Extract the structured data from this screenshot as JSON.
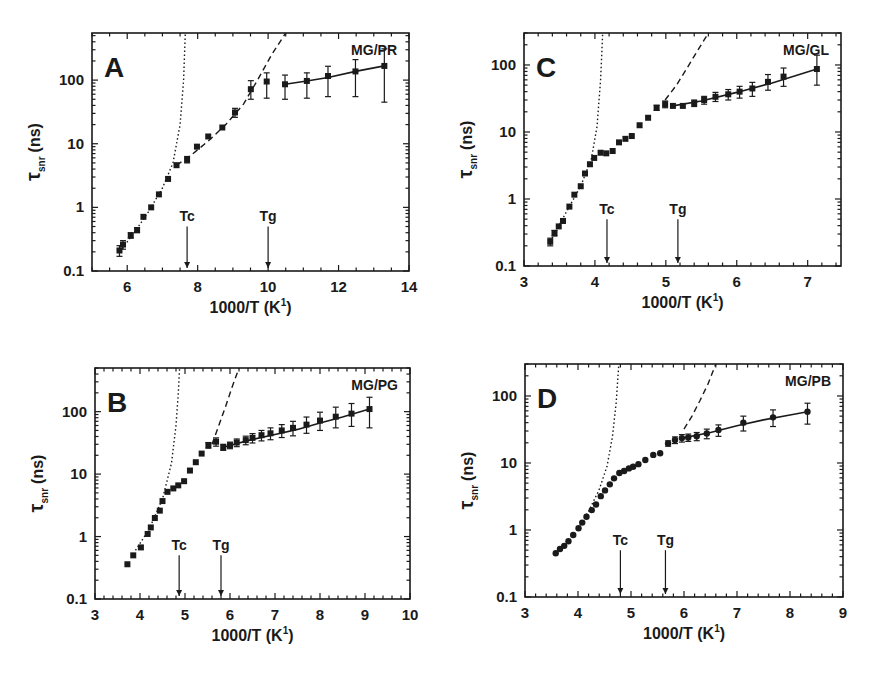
{
  "figure": {
    "panels_order": [
      "A",
      "C",
      "B",
      "D"
    ]
  },
  "chart_data": [
    {
      "id": "A",
      "type": "scatter",
      "panel_letter": "A",
      "system_label": "MG/PR",
      "title": "",
      "xlabel": "1000/T (K⁻¹)",
      "xlabel_main": "1000/T (K",
      "xlabel_sup": "1",
      "xlabel_end": ")",
      "ylabel": "τsnr (ns)",
      "ylabel_tau": "τ",
      "ylabel_sub": "snr",
      "ylabel_unit": "(ns)",
      "yscale": "log",
      "xlim": [
        5,
        14
      ],
      "ylim": [
        0.1,
        550
      ],
      "xticks": [
        6,
        8,
        10,
        12,
        14
      ],
      "xminor": 0.5,
      "yticks": [
        0.1,
        1,
        10,
        100
      ],
      "ytick_labels": [
        "0.1",
        "1",
        "10",
        "100"
      ],
      "grid": false,
      "markers": [
        {
          "label": "Tc",
          "x": 7.7
        },
        {
          "label": "Tg",
          "x": 10.0
        }
      ],
      "series": [
        {
          "name": "data",
          "marker": "square",
          "x": [
            5.78,
            5.88,
            6.1,
            6.28,
            6.46,
            6.68,
            6.9,
            7.16,
            7.4,
            7.7,
            7.98,
            8.3,
            8.7,
            9.06,
            9.51,
            9.96,
            10.48,
            11.1,
            11.7,
            12.48,
            13.3
          ],
          "y": [
            0.21,
            0.26,
            0.36,
            0.44,
            0.71,
            1.0,
            1.6,
            2.8,
            4.6,
            5.6,
            9,
            13,
            18,
            31,
            72,
            95,
            86,
            97,
            116,
            137,
            167
          ],
          "err_low": [
            0.17,
            0.22,
            0.33,
            0.4,
            0.66,
            0.94,
            1.5,
            2.6,
            4.3,
            5.0,
            8.3,
            12,
            17,
            26,
            50,
            52,
            50,
            52,
            55,
            55,
            45
          ],
          "err_high": [
            0.25,
            0.3,
            0.4,
            0.48,
            0.76,
            1.06,
            1.7,
            3.0,
            4.9,
            6.3,
            9.8,
            14,
            19,
            36,
            98,
            130,
            120,
            130,
            165,
            210,
            310
          ]
        },
        {
          "name": "solid fit (glass)",
          "style": "solid",
          "x": [
            10.48,
            11.1,
            11.7,
            12.48,
            13.3
          ],
          "y": [
            86,
            97,
            110,
            137,
            167
          ]
        },
        {
          "name": "dashed fit (supercooled)",
          "style": "dashed",
          "x": [
            7.4,
            7.8,
            8.3,
            8.8,
            9.3,
            9.7,
            10.1,
            10.5
          ],
          "y": [
            4.6,
            6.5,
            11,
            20,
            42,
            100,
            250,
            550
          ]
        },
        {
          "name": "dotted fit (liquid)",
          "style": "dotted",
          "x": [
            5.78,
            6.2,
            6.6,
            7.0,
            7.3,
            7.5,
            7.6,
            7.65
          ],
          "y": [
            0.2,
            0.4,
            0.85,
            2.0,
            5,
            20,
            100,
            550
          ]
        }
      ]
    },
    {
      "id": "C",
      "type": "scatter",
      "panel_letter": "C",
      "system_label": "MG/GL",
      "title": "",
      "xlabel": "1000/T (K⁻¹)",
      "xlabel_main": "1000/T (K",
      "xlabel_sup": "1",
      "xlabel_end": ")",
      "ylabel": "τsnr (ns)",
      "ylabel_tau": "τ",
      "ylabel_sub": "snr",
      "ylabel_unit": "(ns)",
      "yscale": "log",
      "xlim": [
        3,
        7.47
      ],
      "ylim": [
        0.1,
        300
      ],
      "xticks": [
        3,
        4,
        5,
        6,
        7
      ],
      "xminor": 0.2,
      "yticks": [
        0.1,
        1,
        10,
        100
      ],
      "ytick_labels": [
        "0.1",
        "1",
        "10",
        "100"
      ],
      "grid": false,
      "markers": [
        {
          "label": "Tc",
          "x": 4.17
        },
        {
          "label": "Tg",
          "x": 5.17
        }
      ],
      "series": [
        {
          "name": "data",
          "marker": "square",
          "x": [
            3.37,
            3.43,
            3.49,
            3.55,
            3.64,
            3.71,
            3.8,
            3.86,
            3.93,
            3.99,
            4.08,
            4.16,
            4.25,
            4.34,
            4.43,
            4.52,
            4.63,
            4.75,
            4.87,
            4.99,
            5.1,
            5.24,
            5.4,
            5.54,
            5.7,
            5.88,
            6.04,
            6.22,
            6.44,
            6.66,
            7.13
          ],
          "y": [
            0.23,
            0.31,
            0.39,
            0.47,
            0.77,
            1.16,
            1.55,
            2.4,
            3.3,
            4.1,
            4.9,
            4.8,
            5.2,
            7.0,
            7.9,
            8.7,
            12.6,
            16.3,
            23,
            26,
            24.5,
            24.5,
            27,
            30,
            33.5,
            36.5,
            40,
            44.6,
            56,
            67,
            87
          ],
          "err_low": [
            0.2,
            0.28,
            0.36,
            0.44,
            0.73,
            1.1,
            1.48,
            2.3,
            3.15,
            3.9,
            4.7,
            4.6,
            5.0,
            6.7,
            7.6,
            8.4,
            12,
            15.5,
            21,
            23,
            22.5,
            22.5,
            24,
            26,
            28.5,
            30,
            32,
            34,
            42,
            48,
            50
          ],
          "err_high": [
            0.26,
            0.34,
            0.42,
            0.5,
            0.81,
            1.22,
            1.62,
            2.5,
            3.45,
            4.3,
            5.1,
            5.0,
            5.4,
            7.3,
            8.2,
            9.0,
            13.2,
            17.1,
            25,
            29,
            26.5,
            26.5,
            30,
            34,
            39,
            43,
            48,
            55,
            72,
            90,
            140
          ]
        },
        {
          "name": "solid fit (glass)",
          "style": "solid",
          "x": [
            5.1,
            5.5,
            6.0,
            6.5,
            7.13
          ],
          "y": [
            24.5,
            29,
            39,
            54,
            87
          ]
        },
        {
          "name": "dashed fit (supercooled)",
          "style": "dashed",
          "x": [
            4.99,
            5.15,
            5.3,
            5.45,
            5.6
          ],
          "y": [
            30,
            50,
            90,
            165,
            300
          ]
        },
        {
          "name": "dotted fit (liquid)",
          "style": "dotted",
          "x": [
            3.37,
            3.6,
            3.8,
            3.95,
            4.03,
            4.08,
            4.11
          ],
          "y": [
            0.23,
            0.65,
            1.55,
            4.0,
            12,
            60,
            300
          ]
        }
      ]
    },
    {
      "id": "B",
      "type": "scatter",
      "panel_letter": "B",
      "system_label": "MG/PG",
      "title": "",
      "xlabel": "1000/T (K⁻¹)",
      "xlabel_main": "1000/T (K",
      "xlabel_sup": "1",
      "xlabel_end": ")",
      "ylabel": "τsnr (ns)",
      "ylabel_tau": "τ",
      "ylabel_sub": "snr",
      "ylabel_unit": "(ns)",
      "yscale": "log",
      "xlim": [
        3,
        10
      ],
      "ylim": [
        0.1,
        500
      ],
      "xticks": [
        3,
        4,
        5,
        6,
        7,
        8,
        9,
        10
      ],
      "xminor": 0.2,
      "yticks": [
        0.1,
        1,
        10,
        100
      ],
      "ytick_labels": [
        "0.1",
        "1",
        "10",
        "100"
      ],
      "grid": false,
      "markers": [
        {
          "label": "Tc",
          "x": 4.87
        },
        {
          "label": "Tg",
          "x": 5.8
        }
      ],
      "series": [
        {
          "name": "data",
          "marker": "square",
          "x": [
            3.72,
            3.85,
            4.02,
            4.17,
            4.24,
            4.33,
            4.44,
            4.5,
            4.61,
            4.74,
            4.85,
            4.98,
            5.11,
            5.24,
            5.37,
            5.52,
            5.69,
            5.85,
            6.0,
            6.15,
            6.35,
            6.5,
            6.7,
            6.9,
            7.15,
            7.4,
            7.7,
            8.0,
            8.35,
            8.7,
            9.1
          ],
          "y": [
            0.36,
            0.5,
            0.67,
            1.1,
            1.4,
            1.98,
            2.6,
            3.7,
            5.2,
            5.9,
            6.6,
            7.7,
            11.4,
            15.5,
            21.3,
            29,
            33,
            27,
            29,
            32,
            35,
            38,
            42,
            45,
            50,
            55,
            62,
            72,
            83,
            93,
            110
          ],
          "err_low": [
            0.33,
            0.46,
            0.63,
            1.04,
            1.32,
            1.88,
            2.45,
            3.5,
            4.9,
            5.6,
            6.3,
            7.3,
            10.8,
            14.7,
            20.2,
            26,
            28,
            24,
            25.5,
            27.5,
            29.5,
            31.5,
            34,
            35.5,
            38.5,
            41,
            45,
            50,
            55,
            58,
            55
          ],
          "err_high": [
            0.39,
            0.54,
            0.71,
            1.16,
            1.48,
            2.08,
            2.75,
            3.9,
            5.5,
            6.2,
            6.9,
            8.1,
            12,
            16.3,
            22.4,
            32,
            38,
            30,
            32.5,
            36.5,
            40.5,
            44.5,
            50,
            55,
            62,
            70,
            82,
            98,
            118,
            135,
            170
          ]
        },
        {
          "name": "solid fit (glass)",
          "style": "solid",
          "x": [
            5.85,
            6.5,
            7.0,
            7.5,
            8.0,
            8.5,
            9.1
          ],
          "y": [
            27,
            36,
            43,
            52,
            66,
            82,
            110
          ]
        },
        {
          "name": "dashed fit (supercooled)",
          "style": "dashed",
          "x": [
            5.6,
            5.75,
            5.9,
            6.05,
            6.2
          ],
          "y": [
            30,
            60,
            120,
            250,
            500
          ]
        },
        {
          "name": "dotted fit (liquid)",
          "style": "dotted",
          "x": [
            3.9,
            4.2,
            4.5,
            4.7,
            4.8,
            4.85,
            4.88
          ],
          "y": [
            0.6,
            1.3,
            4.0,
            15,
            60,
            200,
            500
          ]
        }
      ]
    },
    {
      "id": "D",
      "type": "scatter",
      "panel_letter": "D",
      "system_label": "MG/PB",
      "title": "",
      "xlabel": "1000/T (K⁻¹)",
      "xlabel_main": "1000/T (K",
      "xlabel_sup": "1",
      "xlabel_end": ")",
      "ylabel": "τsnr (ns)",
      "ylabel_tau": "τ",
      "ylabel_sub": "snr",
      "ylabel_unit": "(ns)",
      "yscale": "log",
      "xlim": [
        3,
        9
      ],
      "ylim": [
        0.1,
        300
      ],
      "xticks": [
        3,
        4,
        5,
        6,
        7,
        8,
        9
      ],
      "xminor": 0.2,
      "yticks": [
        0.1,
        1,
        10,
        100
      ],
      "ytick_labels": [
        "0.1",
        "1",
        "10",
        "100"
      ],
      "grid": false,
      "markers": [
        {
          "label": "Tc",
          "x": 4.8
        },
        {
          "label": "Tg",
          "x": 5.65
        }
      ],
      "series": [
        {
          "name": "data",
          "marker": "circle",
          "x": [
            3.58,
            3.66,
            3.74,
            3.82,
            3.91,
            4.01,
            4.08,
            4.16,
            4.26,
            4.34,
            4.43,
            4.51,
            4.6,
            4.68,
            4.78,
            4.87,
            4.96,
            5.04,
            5.14,
            5.27,
            5.42,
            5.55,
            5.7,
            5.83,
            5.96,
            6.08,
            6.24,
            6.43,
            6.65,
            7.12,
            7.68,
            8.33
          ],
          "y": [
            0.45,
            0.52,
            0.58,
            0.68,
            0.84,
            1.06,
            1.29,
            1.58,
            1.98,
            2.4,
            3.2,
            3.9,
            4.8,
            5.9,
            7.1,
            7.6,
            8.3,
            8.8,
            9.6,
            11.1,
            13.2,
            14,
            19.6,
            22,
            23.5,
            24,
            25,
            27.5,
            31,
            40,
            48,
            58
          ],
          "err_low": [
            0.43,
            0.5,
            0.56,
            0.66,
            0.82,
            1.03,
            1.26,
            1.54,
            1.93,
            2.34,
            3.1,
            3.8,
            4.7,
            5.7,
            6.9,
            7.4,
            8.1,
            8.6,
            9.3,
            10.5,
            12.2,
            13,
            17.8,
            19.5,
            20.5,
            21,
            21.5,
            23,
            25,
            30,
            35,
            38
          ],
          "err_high": [
            0.47,
            0.54,
            0.6,
            0.7,
            0.86,
            1.09,
            1.32,
            1.62,
            2.03,
            2.46,
            3.3,
            4.0,
            4.9,
            6.1,
            7.3,
            7.8,
            8.5,
            9.0,
            9.9,
            11.7,
            14.2,
            15,
            21.4,
            24.5,
            26.5,
            27,
            28.5,
            32,
            37,
            50,
            62,
            78
          ]
        },
        {
          "name": "solid fit (glass)",
          "style": "solid",
          "x": [
            5.96,
            6.5,
            7.0,
            7.5,
            8.0,
            8.33
          ],
          "y": [
            23.5,
            28.5,
            36,
            44,
            52,
            58
          ]
        },
        {
          "name": "dashed fit (supercooled)",
          "style": "dashed",
          "x": [
            6.0,
            6.15,
            6.3,
            6.45,
            6.6
          ],
          "y": [
            32,
            50,
            85,
            150,
            300
          ]
        },
        {
          "name": "dotted fit (liquid)",
          "style": "dotted",
          "x": [
            4.0,
            4.2,
            4.4,
            4.55,
            4.65,
            4.72,
            4.77
          ],
          "y": [
            1.05,
            1.9,
            4.0,
            9.0,
            25,
            80,
            300
          ]
        }
      ]
    }
  ]
}
